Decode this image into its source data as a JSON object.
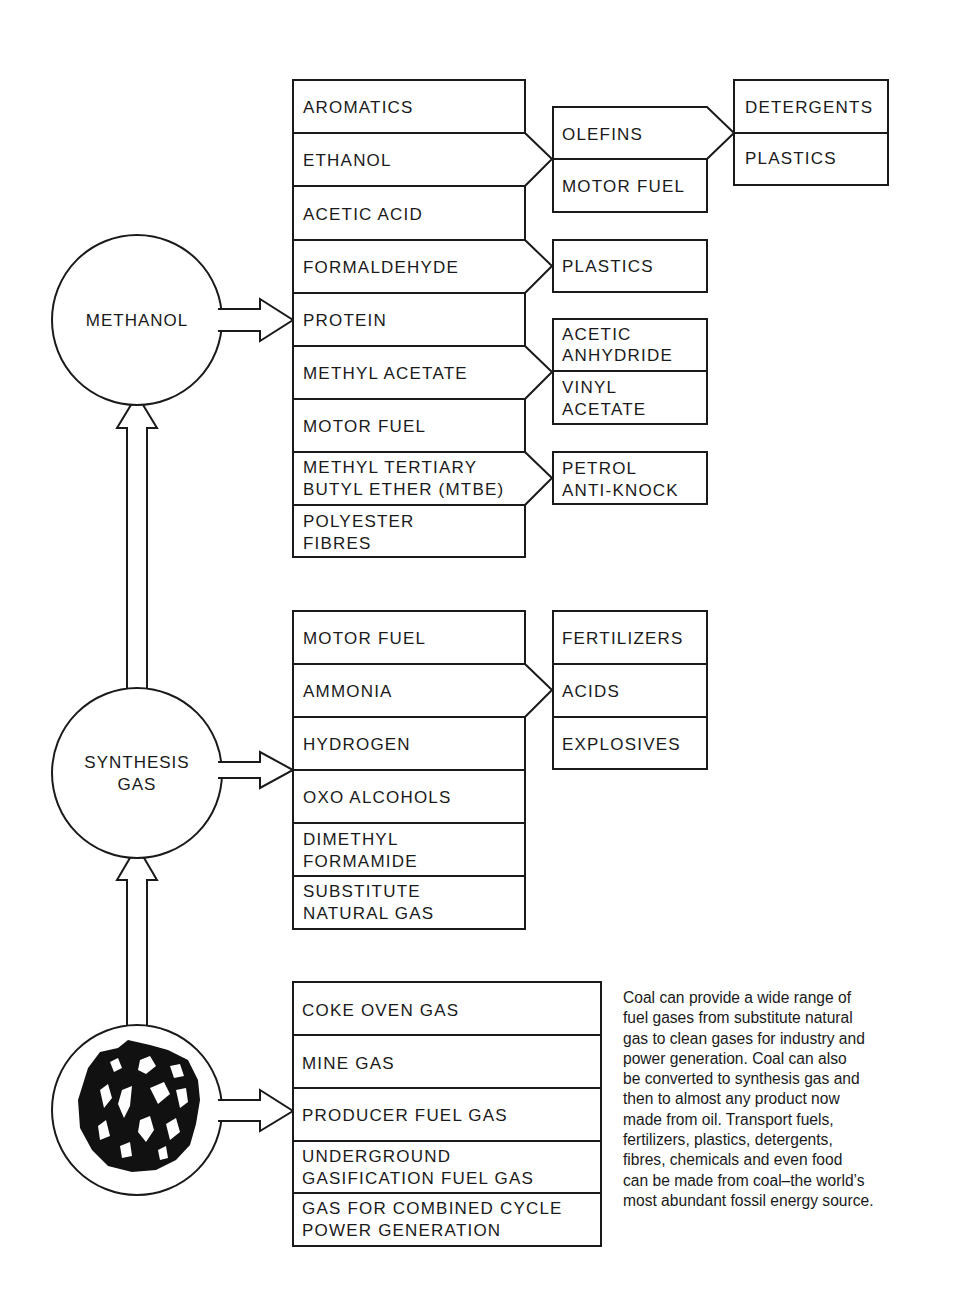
{
  "nodes": {
    "methanol": "METHANOL",
    "synthesis_gas": [
      "SYNTHESIS",
      "GAS"
    ],
    "coal": "coal-lump-image"
  },
  "methanol_products": [
    [
      "AROMATICS"
    ],
    [
      "ETHANOL"
    ],
    [
      "ACETIC ACID"
    ],
    [
      "FORMALDEHYDE"
    ],
    [
      "PROTEIN"
    ],
    [
      "METHYL ACETATE"
    ],
    [
      "MOTOR FUEL"
    ],
    [
      "METHYL TERTIARY",
      "BUTYL ETHER (MTBE)"
    ],
    [
      "POLYESTER",
      "FIBRES"
    ]
  ],
  "methanol_derivatives": {
    "ethanol_group": [
      "OLEFINS",
      "MOTOR FUEL"
    ],
    "olefins_group": [
      "DETERGENTS",
      "PLASTICS"
    ],
    "formaldehyde_group": [
      "PLASTICS"
    ],
    "methyl_acetate_group": [
      [
        "ACETIC",
        "ANHYDRIDE"
      ],
      [
        "VINYL",
        "ACETATE"
      ]
    ],
    "mtbe_group": [
      [
        "PETROL",
        "ANTI-KNOCK"
      ]
    ]
  },
  "synthesis_products": [
    [
      "MOTOR FUEL"
    ],
    [
      "AMMONIA"
    ],
    [
      "HYDROGEN"
    ],
    [
      "OXO ALCOHOLS"
    ],
    [
      "DIMETHYL",
      "FORMAMIDE"
    ],
    [
      "SUBSTITUTE",
      "NATURAL GAS"
    ]
  ],
  "ammonia_derivatives": [
    "FERTILIZERS",
    "ACIDS",
    "EXPLOSIVES"
  ],
  "coal_gases": [
    [
      "COKE OVEN GAS"
    ],
    [
      "MINE GAS"
    ],
    [
      "PRODUCER FUEL GAS"
    ],
    [
      "UNDERGROUND",
      "GASIFICATION FUEL GAS"
    ],
    [
      "GAS FOR COMBINED CYCLE",
      "POWER GENERATION"
    ]
  ],
  "description_lines": [
    "Coal can provide a wide range of",
    "fuel gases from substitute natural",
    "gas to clean gases for industry and",
    "power generation. Coal can also",
    "be converted to synthesis gas and",
    "then to almost any product now",
    "made from oil. Transport fuels,",
    "fertilizers, plastics, detergents,",
    "fibres, chemicals and even food",
    "can be made from coal–the world’s",
    "most abundant fossil energy source."
  ]
}
